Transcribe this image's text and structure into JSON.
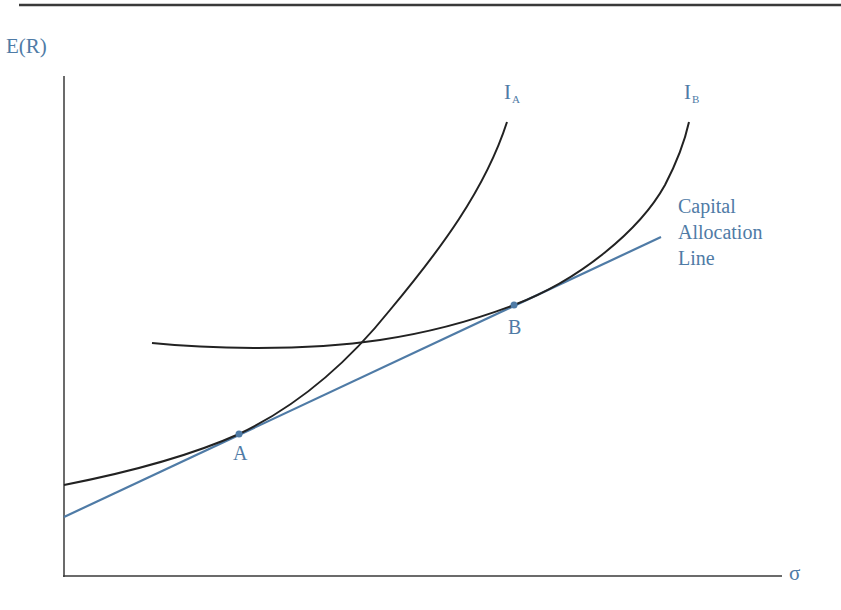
{
  "diagram": {
    "y_axis_label": "E(R)",
    "x_axis_label": "σ",
    "curves": [
      {
        "id": "IA",
        "label_main": "I",
        "label_sub": "A",
        "color": "#222222"
      },
      {
        "id": "IB",
        "label_main": "I",
        "label_sub": "B",
        "color": "#222222"
      }
    ],
    "line": {
      "label_lines": [
        "Capital",
        "Allocation",
        "Line"
      ],
      "color": "#4f7ba6"
    },
    "points": [
      {
        "label": "A",
        "color": "#4f7ba6"
      },
      {
        "label": "B",
        "color": "#4f7ba6"
      }
    ],
    "colors": {
      "axis": "#3a3a3a",
      "curve": "#222222",
      "accent": "#4f7ba6",
      "label": "#4f7ba6"
    }
  }
}
